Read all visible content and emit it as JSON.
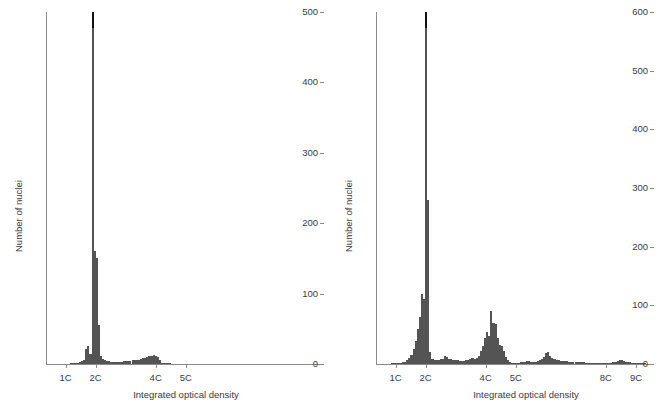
{
  "figure": {
    "background": "#ffffff",
    "bar_color": "#545454",
    "cap_color": "#111111",
    "axis_color": "#8a8a8a",
    "text_color": "#3a3a3a"
  },
  "chart_data": [
    {
      "id": "left",
      "type": "bar",
      "title": "",
      "xlabel": "Integrated optical density",
      "ylabel": "Number of nuclei",
      "ylim": [
        0,
        500
      ],
      "yticks": [
        0,
        100,
        200,
        300,
        400,
        500
      ],
      "ytick_labels": [
        "0",
        "100",
        "200",
        "300",
        "400",
        "500"
      ],
      "xlim": [
        0.35,
        9.6
      ],
      "xticks": [
        1,
        2,
        4,
        5
      ],
      "xtick_labels": [
        "1C",
        "2C",
        "4C",
        "5C"
      ],
      "grid": false,
      "legend": null,
      "clipped_peak": true,
      "clipped_peak_note": "2C peak truncated at axis maximum, drawn with black cap",
      "bin_width_c": 0.07,
      "x": [
        1.2,
        1.27,
        1.34,
        1.41,
        1.48,
        1.55,
        1.62,
        1.69,
        1.76,
        1.83,
        1.9,
        1.97,
        2.04,
        2.11,
        2.18,
        2.25,
        2.32,
        2.39,
        2.46,
        2.53,
        2.6,
        2.67,
        2.74,
        2.81,
        2.88,
        2.95,
        3.02,
        3.09,
        3.16,
        3.23,
        3.3,
        3.37,
        3.44,
        3.51,
        3.58,
        3.65,
        3.72,
        3.79,
        3.86,
        3.93,
        4.0,
        4.07,
        4.14,
        4.21,
        4.28,
        4.35,
        4.42,
        4.49
      ],
      "values": [
        1,
        1,
        2,
        2,
        3,
        4,
        6,
        22,
        25,
        14,
        500,
        160,
        150,
        55,
        12,
        7,
        5,
        4,
        4,
        3,
        3,
        3,
        3,
        3,
        3,
        4,
        4,
        4,
        4,
        5,
        5,
        5,
        6,
        7,
        8,
        9,
        10,
        11,
        12,
        13,
        12,
        10,
        5,
        2,
        1,
        1,
        1,
        1
      ]
    },
    {
      "id": "right",
      "type": "bar",
      "title": "",
      "xlabel": "Integrated optical density",
      "ylabel": "Number of nuclei",
      "ylim": [
        0,
        600
      ],
      "yticks": [
        0,
        100,
        200,
        300,
        400,
        500,
        600
      ],
      "ytick_labels": [
        "0",
        "100",
        "200",
        "300",
        "400",
        "500",
        "600"
      ],
      "xlim": [
        0.35,
        9.6
      ],
      "xticks": [
        1,
        2,
        4,
        5,
        8,
        9
      ],
      "xtick_labels": [
        "1C",
        "2C",
        "4C",
        "5C",
        "8C",
        "9C"
      ],
      "grid": false,
      "legend": null,
      "clipped_peak": true,
      "clipped_peak_note": "2C peak truncated at axis maximum, drawn with black cap",
      "bin_width_c": 0.07,
      "x": [
        0.9,
        0.97,
        1.04,
        1.11,
        1.18,
        1.25,
        1.32,
        1.39,
        1.46,
        1.53,
        1.6,
        1.67,
        1.74,
        1.81,
        1.88,
        1.95,
        2.02,
        2.09,
        2.16,
        2.23,
        2.3,
        2.37,
        2.44,
        2.51,
        2.58,
        2.65,
        2.72,
        2.79,
        2.86,
        2.93,
        3.0,
        3.07,
        3.14,
        3.21,
        3.28,
        3.35,
        3.42,
        3.49,
        3.56,
        3.63,
        3.7,
        3.77,
        3.84,
        3.91,
        3.98,
        4.05,
        4.12,
        4.19,
        4.26,
        4.33,
        4.4,
        4.47,
        4.54,
        4.61,
        4.68,
        4.75,
        4.82,
        4.89,
        4.96,
        5.03,
        5.1,
        5.17,
        5.24,
        5.31,
        5.38,
        5.45,
        5.52,
        5.59,
        5.66,
        5.73,
        5.8,
        5.87,
        5.94,
        6.01,
        6.08,
        6.15,
        6.22,
        6.29,
        6.36,
        6.43,
        6.5,
        6.57,
        6.64,
        6.71,
        6.78,
        6.85,
        6.92,
        6.99,
        7.06,
        7.13,
        7.2,
        7.27,
        7.34,
        7.41,
        7.48,
        7.55,
        7.62,
        7.69,
        7.76,
        7.83,
        7.9,
        7.97,
        8.04,
        8.11,
        8.18,
        8.25,
        8.32,
        8.39,
        8.46,
        8.53,
        8.6,
        8.67,
        8.74,
        8.81,
        8.88,
        8.95,
        9.02,
        9.09,
        9.16,
        9.23,
        9.3
      ],
      "values": [
        1,
        1,
        1,
        2,
        2,
        3,
        4,
        6,
        10,
        16,
        25,
        40,
        60,
        80,
        120,
        110,
        600,
        280,
        20,
        9,
        7,
        6,
        7,
        8,
        9,
        14,
        12,
        9,
        8,
        7,
        6,
        6,
        5,
        5,
        5,
        6,
        7,
        8,
        10,
        9,
        11,
        14,
        22,
        30,
        45,
        55,
        48,
        90,
        70,
        68,
        45,
        32,
        30,
        22,
        12,
        6,
        3,
        2,
        2,
        2,
        2,
        3,
        3,
        4,
        5,
        5,
        4,
        4,
        4,
        5,
        6,
        8,
        12,
        18,
        20,
        14,
        10,
        8,
        7,
        6,
        5,
        5,
        5,
        5,
        4,
        4,
        4,
        4,
        3,
        3,
        3,
        3,
        2,
        2,
        2,
        2,
        2,
        2,
        2,
        1,
        1,
        1,
        1,
        1,
        2,
        3,
        4,
        5,
        6,
        6,
        5,
        4,
        3,
        3,
        2,
        2,
        2,
        1,
        1,
        1,
        1
      ]
    }
  ]
}
